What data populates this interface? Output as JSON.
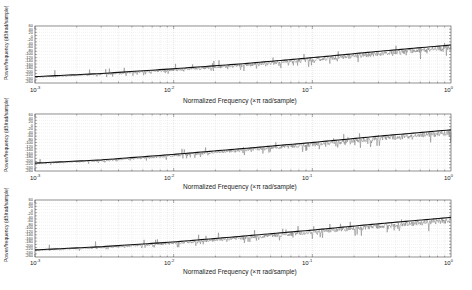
{
  "figure": {
    "background": "#ffffff",
    "line_color": "#111111",
    "noise_color": "#6e6e6e",
    "grid_color": "#d0d0d0"
  },
  "chart_data": [
    {
      "type": "line",
      "title": "",
      "xlabel": "Normalized Frequency (×π rad/sample)",
      "ylabel": "Power/frequency (dB/rad/sample)",
      "xscale": "log",
      "xlim": [
        0.001,
        1
      ],
      "x_ticks": [
        "10^-3",
        "10^-2",
        "10^-1",
        "10^0"
      ],
      "ylim": [
        -300,
        60
      ],
      "grid": true,
      "legend": null,
      "series": [
        {
          "name": "PSD trend",
          "x": [
            0.001,
            0.003,
            0.01,
            0.03,
            0.1,
            0.3,
            1.0
          ],
          "values": [
            -260,
            -240,
            -210,
            -180,
            -140,
            -100,
            -60
          ]
        }
      ]
    },
    {
      "type": "line",
      "title": "",
      "xlabel": "Normalized Frequency (×π rad/sample)",
      "ylabel": "Power/frequency (dB/rad/sample)",
      "xscale": "log",
      "xlim": [
        0.001,
        1
      ],
      "x_ticks": [
        "10^-3",
        "10^-2",
        "10^-1",
        "10^0"
      ],
      "ylim": [
        -300,
        60
      ],
      "grid": true,
      "legend": null,
      "series": [
        {
          "name": "PSD trend",
          "x": [
            0.001,
            0.003,
            0.01,
            0.03,
            0.1,
            0.3,
            1.0
          ],
          "values": [
            -250,
            -230,
            -195,
            -160,
            -120,
            -80,
            -40
          ]
        }
      ]
    },
    {
      "type": "line",
      "title": "",
      "xlabel": "Normalized Frequency (×π rad/sample)",
      "ylabel": "Power/frequency (dB/rad/sample)",
      "xscale": "log",
      "xlim": [
        0.001,
        1
      ],
      "x_ticks": [
        "10^-3",
        "10^-2",
        "10^-1",
        "10^0"
      ],
      "ylim": [
        -300,
        60
      ],
      "grid": true,
      "legend": null,
      "series": [
        {
          "name": "PSD trend",
          "x": [
            0.001,
            0.003,
            0.01,
            0.03,
            0.1,
            0.3,
            1.0
          ],
          "values": [
            -255,
            -235,
            -205,
            -170,
            -130,
            -90,
            -50
          ]
        }
      ]
    }
  ],
  "panels": [
    {
      "xlabel": "Normalized Frequency (×π rad/sample)",
      "ylabel": "Power/frequency (dB/rad/sample)",
      "xt0": "10",
      "xt0e": "-3",
      "xt1": "10",
      "xt1e": "-2",
      "xt2": "10",
      "xt2e": "-1",
      "xt3": "10",
      "xt3e": "0"
    },
    {
      "xlabel": "Normalized Frequency (×π rad/sample)",
      "ylabel": "Power/frequency (dB/rad/sample)",
      "xt0": "10",
      "xt0e": "-3",
      "xt1": "10",
      "xt1e": "-2",
      "xt2": "10",
      "xt2e": "-1",
      "xt3": "10",
      "xt3e": "0"
    },
    {
      "xlabel": "Normalized Frequency (×π rad/sample)",
      "ylabel": "Power/frequency (dB/rad/sample)",
      "xt0": "10",
      "xt0e": "-3",
      "xt1": "10",
      "xt1e": "-2",
      "xt2": "10",
      "xt2e": "-1",
      "xt3": "10",
      "xt3e": "0"
    }
  ],
  "yticks_labels": [
    "60",
    "40",
    "20",
    "0",
    "-20",
    "-40",
    "-60",
    "-80",
    "-100",
    "-120",
    "-140",
    "-160",
    "-180",
    "-200",
    "-220",
    "-240",
    "-260",
    "-280",
    "-300"
  ]
}
